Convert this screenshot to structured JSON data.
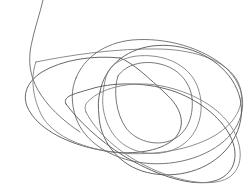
{
  "artwork": {
    "title": "Overlapping loop scribble",
    "medium": "pen line drawing",
    "background_color": "#ffffff",
    "stroke_color": "#6a6a6a",
    "stroke_color_dark": "#555555",
    "stroke_color_light": "#808080",
    "stroke_width": 0.9,
    "canvas_width": 252,
    "canvas_height": 195,
    "description": "A continuous free-hand scribble made of several large overlapping ellipse-like loops rotated slightly from each other, with a long tail running off the top edge of the frame.",
    "loop_count": 8
  },
  "chart_data": {
    "type": "line",
    "xlabel": "",
    "ylabel": "",
    "xlim": [
      0,
      252
    ],
    "ylim": [
      0,
      195
    ],
    "grid": false,
    "legend": "none",
    "series": [
      {
        "name": "tail-stroke",
        "note": "Long tail entering from the top edge, curving down and to the left before joining the loop cluster.",
        "path": "M 44 -4 C 40 14 34 30 31 46 C 28 62 30 76 38 90 C 47 106 62 120 80 132"
      },
      {
        "name": "loop-1-outer-left-ellipse",
        "note": "Large left-leaning ellipse, leftmost extent near x=23, y=92.",
        "path": "M 120 58 C 92 55 62 60 42 72 C 25 83 21 98 30 112 C 41 130 68 144 100 150 C 130 156 160 152 174 139 C 187 126 182 108 165 93 C 150 79 132 62 120 58 Z"
      },
      {
        "name": "loop-2-wide-horizontal-ellipse",
        "note": "Wide flattened ellipse spanning almost the full width, crossing near y=60 on the left.",
        "path": "M 36 62 C 70 55 118 48 160 49 C 198 50 228 62 238 82 C 247 101 238 122 214 136 C 188 151 148 157 112 152 C 78 147 52 134 42 116 C 33 99 30 78 36 62 Z"
      },
      {
        "name": "loop-3-upper-arc-ellipse",
        "note": "Ellipse whose top arc peaks near y=40 around x=120; sweeps right to x=240.",
        "path": "M 76 78 C 84 58 104 43 132 40 C 166 37 204 48 226 68 C 246 87 248 112 232 133 C 214 155 178 167 144 163 C 110 159 84 141 76 118 C 71 104 71 89 76 78 Z"
      },
      {
        "name": "loop-4-right-tilted-ellipse",
        "note": "Tilted ellipse biased to the right half of the frame.",
        "path": "M 100 92 C 104 68 124 50 152 46 C 184 42 216 56 232 80 C 247 103 244 131 224 152 C 204 173 170 180 142 171 C 115 162 100 138 99 116 C 98 107 98 99 100 92 Z"
      },
      {
        "name": "loop-5-inner-rounded-loop",
        "note": "Inner rounded-rectangle loop in the middle, left edge near x=102.",
        "path": "M 108 72 C 114 60 132 54 152 56 C 174 58 192 70 198 88 C 205 108 200 130 186 142 C 170 156 144 157 126 146 C 108 135 101 112 103 94 C 104 85 105 78 108 72 Z"
      },
      {
        "name": "loop-6-innermost-small-loop",
        "note": "Smallest innermost loop, tight around the middle-right core.",
        "path": "M 118 76 C 126 64 144 60 160 64 C 178 68 190 82 192 98 C 194 118 186 134 172 140 C 156 147 136 141 126 128 C 116 114 113 90 118 76 Z"
      },
      {
        "name": "loop-7-lower-sweep-ellipse",
        "note": "Lower sweeping ellipse forming the bottom band of near-parallel curves, lowest point near y=188.",
        "path": "M 66 104 C 78 120 98 140 124 156 C 152 173 186 186 210 182 C 232 178 240 160 232 140 C 224 120 202 102 176 92 C 148 82 116 82 94 88 C 74 94 62 96 66 104 Z"
      },
      {
        "name": "loop-8-bottom-outer-ellipse",
        "note": "Outer bottom ellipse passing through the lower-right corner region.",
        "path": "M 86 112 C 96 132 118 152 146 166 C 176 181 210 188 228 178 C 243 169 244 148 232 128 C 219 107 192 92 162 86 C 132 80 104 88 92 98 C 85 103 84 107 86 112 Z"
      }
    ]
  }
}
